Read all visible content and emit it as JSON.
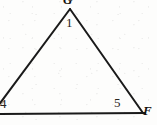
{
  "figure": {
    "kind": "triangle-geometry-diagram",
    "background_color": "#fdfdfc",
    "stroke_color": "#1a1a1a",
    "stroke_width": 2,
    "width": 157,
    "height": 125,
    "vertices": [
      {
        "id": "apex",
        "label": "G",
        "kind": "vertex",
        "x": 70,
        "y": 9,
        "clipped_by_edge": "top"
      },
      {
        "id": "lower-left",
        "label": "",
        "kind": "vertex",
        "x": -6,
        "y": 113,
        "clipped_by_edge": "left"
      },
      {
        "id": "lower-right",
        "label": "F",
        "kind": "vertex",
        "x": 143,
        "y": 113,
        "clipped_by_edge": "none"
      }
    ],
    "segments": [
      {
        "id": "left-side",
        "from": "apex",
        "to": "lower-left",
        "x1": 70,
        "y1": 9,
        "x2": -8,
        "y2": 114
      },
      {
        "id": "right-side",
        "from": "apex",
        "to": "lower-right",
        "x1": 70,
        "y1": 9,
        "x2": 143,
        "y2": 113
      },
      {
        "id": "base-line",
        "from": "lower-left",
        "to": "lower-right",
        "x1": -8,
        "y1": 114,
        "x2": 145,
        "y2": 113
      }
    ],
    "angle_labels": [
      {
        "id": "angle-1",
        "text": "1",
        "at_vertex": "apex",
        "x": 66,
        "y": 16
      },
      {
        "id": "angle-4",
        "text": "4",
        "at_vertex": "lower-left",
        "x": 0,
        "y": 97
      },
      {
        "id": "angle-5",
        "text": "5",
        "at_vertex": "lower-right",
        "x": 114,
        "y": 96
      }
    ],
    "vertex_labels": [
      {
        "id": "vertex-g",
        "text": "G",
        "x": 63,
        "y": -7,
        "style": "italic-serif"
      },
      {
        "id": "vertex-f",
        "text": "F",
        "x": 143,
        "y": 104,
        "style": "italic-serif"
      }
    ]
  }
}
